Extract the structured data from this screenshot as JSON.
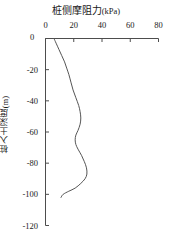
{
  "chart_data": {
    "type": "line",
    "title": "桩侧摩阻力(kPa)",
    "title_main": "桩侧摩阻力",
    "title_unit": "(kPa)",
    "xlabel": "桩侧摩阻力(kPa)",
    "ylabel": "桩入土深度(m)",
    "xaxis_position": "top",
    "grid": false,
    "legend": false,
    "xlim": [
      0,
      80
    ],
    "ylim": [
      -120,
      0
    ],
    "xticks": [
      0,
      20,
      40,
      60,
      80
    ],
    "xticklabels": [
      "0",
      "20",
      "40",
      "60",
      "80"
    ],
    "yticks": [
      0,
      -20,
      -40,
      -60,
      -80,
      -100,
      -120
    ],
    "yticklabels": [
      "0",
      "-20",
      "-40",
      "-60",
      "-80",
      "-100",
      "-120"
    ],
    "line_color": "#555555",
    "line_width": 1,
    "series": [
      {
        "name": "桩侧摩阻力",
        "x": [
          6.0,
          7.5,
          9.5,
          11.5,
          13.5,
          15.0,
          16.5,
          18.0,
          19.5,
          21.5,
          23.5,
          24.5,
          25.0,
          24.5,
          23.0,
          21.5,
          21.0,
          21.5,
          23.0,
          25.5,
          27.5,
          29.0,
          29.3,
          28.0,
          25.0,
          21.0,
          16.5,
          12.5,
          11.0
        ],
        "y": [
          0,
          -3,
          -7,
          -11,
          -15,
          -19,
          -23,
          -28,
          -33,
          -38,
          -43,
          -47,
          -51,
          -55,
          -59,
          -62,
          -65,
          -68,
          -71,
          -75,
          -79,
          -83,
          -87,
          -90,
          -93,
          -96,
          -98,
          -100,
          -102
        ]
      }
    ]
  }
}
